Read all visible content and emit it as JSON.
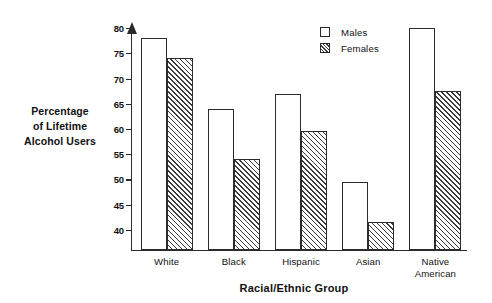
{
  "chart_data": {
    "type": "bar",
    "title": "",
    "subtitle": "",
    "xlabel": "Racial/Ethnic Group",
    "ylabel": "Percentage\nof Lifetime\nAlcohol Users",
    "ylabel_lines": [
      "Percentage",
      "of Lifetime",
      "Alcohol Users"
    ],
    "categories": [
      "White",
      "Black",
      "Hispanic",
      "Asian",
      "Native\nAmerican"
    ],
    "category_labels": [
      "White",
      "Black",
      "Hispanic",
      "Asian",
      "Native American"
    ],
    "series": [
      {
        "name": "Males",
        "fill": "open",
        "values": [
          78,
          64,
          67,
          49.5,
          80
        ]
      },
      {
        "name": "Females",
        "fill": "hatched",
        "values": [
          74,
          54,
          59.5,
          41.5,
          67.5
        ]
      }
    ],
    "ylim": [
      36,
      82
    ],
    "yticks": [
      40,
      45,
      50,
      55,
      60,
      65,
      70,
      75,
      80
    ],
    "ytick_labels": [
      "40",
      "45",
      "50",
      "55",
      "60",
      "65",
      "70",
      "75",
      "80"
    ],
    "xticks_visible": false,
    "grid": false,
    "legend_position": "top-right",
    "axis_color": "#2b2b2b",
    "bar_edge_color": "#2b2b2b",
    "bar_face_color": "#ffffff",
    "hatch_color": "#3a3a3a",
    "hatch_pattern": "forward-diagonal",
    "text_color": "#111111",
    "background": "#ffffff"
  },
  "legend": {
    "items": [
      {
        "label": "Males",
        "swatch": "open-square-icon"
      },
      {
        "label": "Females",
        "swatch": "hatched-square-icon"
      }
    ]
  }
}
